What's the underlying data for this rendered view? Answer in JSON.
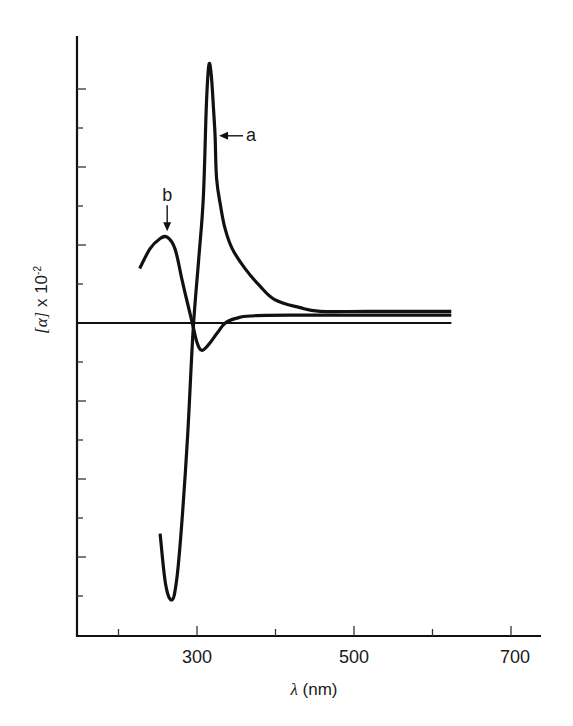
{
  "chart_data": {
    "type": "line",
    "title": "",
    "xlabel": "λ (nm)",
    "xlabel_symbol": "λ",
    "xlabel_unit": "(nm)",
    "ylabel": "[α] x 10-2",
    "ylabel_symbol": "[α]",
    "ylabel_mult": " x 10",
    "ylabel_exp": "-2",
    "xlim": [
      160,
      740
    ],
    "ylim": [
      -8,
      7.4
    ],
    "x_ticks": [
      200,
      300,
      400,
      500,
      600,
      700
    ],
    "x_tick_labels": [
      {
        "value": 300,
        "label": "300"
      },
      {
        "value": 500,
        "label": "500"
      },
      {
        "value": 700,
        "label": "700"
      }
    ],
    "y_ticks": [
      -7,
      -6,
      -5,
      -4,
      -3,
      -2,
      -1,
      1,
      2,
      3,
      4,
      5,
      6
    ],
    "y_tick_labels": [],
    "zero_line": {
      "x_start": 160,
      "x_end": 624,
      "y": 0
    },
    "grid": false,
    "legend": "inline arrow annotations",
    "series": [
      {
        "name": "a",
        "x": [
          253,
          260,
          268,
          274,
          280,
          288,
          295,
          302,
          308,
          312,
          315,
          318,
          321,
          323,
          325,
          330,
          336,
          345,
          361,
          380,
          399,
          430,
          457,
          520,
          624
        ],
        "y": [
          -5.4,
          -6.7,
          -7.1,
          -6.6,
          -5.3,
          -2.9,
          -0.2,
          1.6,
          3.2,
          5.6,
          6.6,
          6.4,
          5.5,
          4.8,
          3.7,
          3.0,
          2.4,
          1.9,
          1.4,
          0.95,
          0.6,
          0.4,
          0.3,
          0.3,
          0.3
        ]
      },
      {
        "name": "b",
        "x": [
          227,
          240,
          252,
          262,
          272,
          281,
          288,
          294,
          300,
          306,
          315,
          326,
          336,
          350,
          368,
          420,
          624
        ],
        "y": [
          1.4,
          1.9,
          2.15,
          2.2,
          1.9,
          1.1,
          0.5,
          0.0,
          -0.5,
          -0.7,
          -0.55,
          -0.25,
          0.0,
          0.12,
          0.18,
          0.2,
          0.2
        ]
      }
    ],
    "annotations": [
      {
        "series": "a",
        "text": "a",
        "arrow": "left",
        "at_x": 323,
        "at_y": 4.8
      },
      {
        "series": "b",
        "text": "b",
        "arrow": "down",
        "at_x": 262,
        "at_y": 2.2
      }
    ]
  },
  "colors": {
    "line": "#111111",
    "axis": "#111111",
    "text": "#1a1a1a",
    "background": "#ffffff"
  }
}
